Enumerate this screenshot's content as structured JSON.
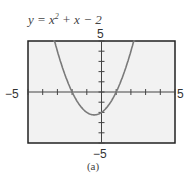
{
  "caption": "(a)",
  "colors": {
    "curve": "#7a7a7a",
    "frame": "#222222",
    "plot_bg": "#f2f2f2"
  },
  "chart_data": {
    "type": "line",
    "function": "x^2 + x - 2",
    "xlabel": "",
    "ylabel": "",
    "xlim": [
      -5,
      5
    ],
    "ylim": [
      -5,
      5
    ],
    "x_tick_step": 1,
    "y_tick_step": 1,
    "tick_labels": {
      "x_min": "-5",
      "x_max": "5",
      "y_min": "-5",
      "y_max": "5"
    },
    "x": [
      -3.3,
      -3,
      -2.5,
      -2,
      -1.5,
      -1,
      -0.5,
      0,
      0.5,
      1,
      1.5,
      2,
      2.3
    ],
    "y": [
      5.59,
      4,
      1.75,
      0,
      -1.25,
      -2,
      -2.25,
      -2,
      -1.25,
      0,
      1.75,
      4,
      5.59
    ],
    "annotations": [
      "(a)"
    ],
    "grid": false
  }
}
